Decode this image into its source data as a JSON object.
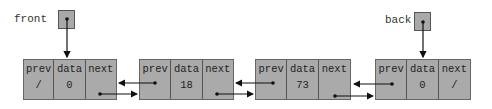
{
  "diagram": {
    "type": "doubly-linked-list",
    "colors": {
      "node_fill": "#aaaaaa",
      "border": "#555555",
      "arrow": "#111111"
    },
    "pointers": [
      {
        "name": "front",
        "label": "front",
        "points_to_node": 0
      },
      {
        "name": "back",
        "label": "back",
        "points_to_node": 3
      }
    ],
    "field_labels": {
      "prev": "prev",
      "data": "data",
      "next": "next"
    },
    "nodes": [
      {
        "prev": "/",
        "data": "0",
        "next": ""
      },
      {
        "prev": "",
        "data": "18",
        "next": ""
      },
      {
        "prev": "",
        "data": "73",
        "next": ""
      },
      {
        "prev": "",
        "data": "0",
        "next": "/"
      }
    ]
  }
}
